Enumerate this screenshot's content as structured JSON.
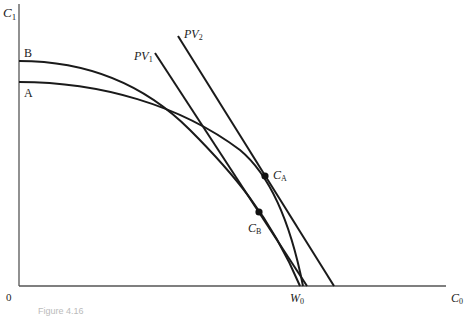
{
  "diagram": {
    "axes": {
      "y_label": "C",
      "y_label_sub": "1",
      "x_label": "C",
      "x_label_sub": "0",
      "origin_label": "0",
      "w0_label": "W",
      "w0_label_sub": "0"
    },
    "curves": [
      {
        "id": "B",
        "label": "B",
        "description": "production opportunity curve B"
      },
      {
        "id": "A",
        "label": "A",
        "description": "production opportunity curve A"
      }
    ],
    "lines": [
      {
        "id": "PV1",
        "label": "PV",
        "label_sub": "1"
      },
      {
        "id": "PV2",
        "label": "PV",
        "label_sub": "2"
      }
    ],
    "points": [
      {
        "id": "CA",
        "label": "C",
        "label_sub": "A"
      },
      {
        "id": "CB",
        "label": "C",
        "label_sub": "B"
      }
    ],
    "caption": "Figure 4.16"
  }
}
